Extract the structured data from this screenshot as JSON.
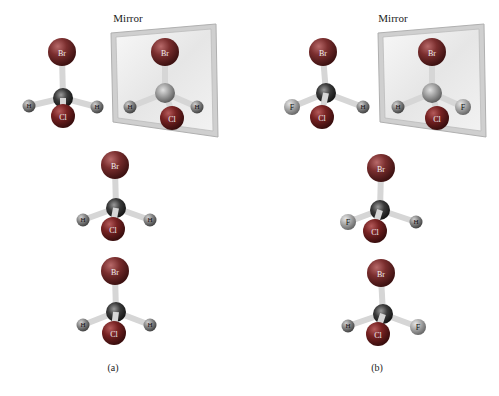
{
  "figure": {
    "mirror_label": "Mirror",
    "panels": [
      {
        "id": "a",
        "label": "(a)",
        "atoms_legend": [
          "Br",
          "Cl",
          "H",
          "H"
        ],
        "molecules": [
          {
            "role": "original",
            "atoms": {
              "top": "Br",
              "front": "Cl",
              "left": "H",
              "right": "H"
            }
          },
          {
            "role": "mirror-image",
            "atoms": {
              "top": "Br",
              "front": "Cl",
              "left": "H",
              "right": "H"
            }
          },
          {
            "role": "rotated-1",
            "atoms": {
              "top": "Br",
              "front": "Cl",
              "left": "H",
              "right": "H"
            }
          },
          {
            "role": "rotated-2",
            "atoms": {
              "top": "Br",
              "front": "Cl",
              "left": "H",
              "right": "H"
            }
          }
        ]
      },
      {
        "id": "b",
        "label": "(b)",
        "molecules": [
          {
            "role": "original",
            "atoms": {
              "top": "Br",
              "front": "Cl",
              "left": "F",
              "right": "H"
            }
          },
          {
            "role": "mirror-image",
            "atoms": {
              "top": "Br",
              "front": "Cl",
              "left": "H",
              "right": "F"
            }
          },
          {
            "role": "rotated-1",
            "atoms": {
              "top": "Br",
              "front": "Cl",
              "left": "F",
              "right": "H"
            }
          },
          {
            "role": "rotated-2",
            "atoms": {
              "top": "Br",
              "front": "Cl",
              "left": "H",
              "right": "F"
            }
          }
        ]
      }
    ]
  },
  "colors": {
    "bromine": "#6e2a2a",
    "chlorine": "#6b2020",
    "hydrogen": "#8a8a8a",
    "fluorine": "#a8a8a8",
    "carbon": "#2e2e2e",
    "bond": "#d8d8d8",
    "mirror_frame": "#c9c9c9",
    "mirror_glass": "#eeeeee"
  },
  "labels": {
    "br": "Br",
    "cl": "Cl",
    "h": "H",
    "f": "F"
  }
}
